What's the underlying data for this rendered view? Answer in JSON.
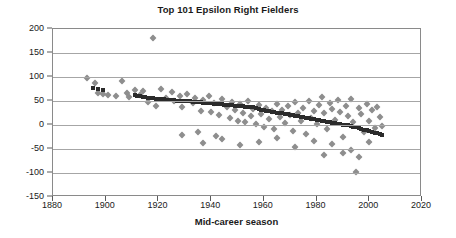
{
  "chart_data": {
    "type": "scatter",
    "title": "Top 101 Epsilon Right Fielders",
    "xlabel": "Mid-career season",
    "ylabel": "",
    "xlim": [
      1880,
      2020
    ],
    "ylim": [
      -150,
      200
    ],
    "xticks": [
      1880,
      1900,
      1920,
      1940,
      1960,
      1980,
      2000,
      2020
    ],
    "yticks": [
      200,
      150,
      100,
      50,
      0,
      -50,
      -100,
      -150
    ],
    "grid": "horizontal",
    "legend": "none",
    "colors": {
      "series_fitted": "#2b2b2b",
      "series_observed": "#8e8e8e",
      "gridline": "#a6a6a6",
      "frame": "#8a8a8a",
      "text": "#1a1a1a",
      "background": "#ffffff"
    },
    "series": [
      {
        "name": "Fitted trend",
        "marker": "square",
        "color": "#2b2b2b",
        "points": [
          [
            1895,
            78
          ],
          [
            1897,
            74
          ],
          [
            1899,
            72
          ],
          [
            1911,
            62
          ],
          [
            1912,
            61
          ],
          [
            1913,
            60
          ],
          [
            1914,
            59
          ],
          [
            1915,
            58
          ],
          [
            1916,
            57
          ],
          [
            1917,
            56
          ],
          [
            1918,
            56
          ],
          [
            1919,
            55
          ],
          [
            1920,
            55
          ],
          [
            1921,
            54
          ],
          [
            1922,
            54
          ],
          [
            1923,
            53
          ],
          [
            1924,
            53
          ],
          [
            1925,
            52
          ],
          [
            1926,
            52
          ],
          [
            1927,
            51
          ],
          [
            1928,
            51
          ],
          [
            1929,
            50
          ],
          [
            1930,
            50
          ],
          [
            1931,
            49
          ],
          [
            1932,
            49
          ],
          [
            1933,
            48
          ],
          [
            1934,
            48
          ],
          [
            1935,
            47
          ],
          [
            1936,
            47
          ],
          [
            1937,
            46
          ],
          [
            1938,
            46
          ],
          [
            1939,
            45
          ],
          [
            1940,
            45
          ],
          [
            1941,
            44
          ],
          [
            1942,
            44
          ],
          [
            1943,
            43
          ],
          [
            1944,
            43
          ],
          [
            1945,
            42
          ],
          [
            1946,
            42
          ],
          [
            1947,
            41
          ],
          [
            1948,
            41
          ],
          [
            1949,
            40
          ],
          [
            1950,
            40
          ],
          [
            1951,
            39
          ],
          [
            1952,
            39
          ],
          [
            1953,
            38
          ],
          [
            1954,
            38
          ],
          [
            1955,
            37
          ],
          [
            1956,
            37
          ],
          [
            1957,
            36
          ],
          [
            1958,
            33
          ],
          [
            1959,
            32
          ],
          [
            1960,
            31
          ],
          [
            1961,
            30
          ],
          [
            1962,
            29
          ],
          [
            1963,
            28
          ],
          [
            1964,
            27
          ],
          [
            1965,
            26
          ],
          [
            1966,
            25
          ],
          [
            1967,
            24
          ],
          [
            1968,
            23
          ],
          [
            1969,
            22
          ],
          [
            1970,
            21
          ],
          [
            1971,
            20
          ],
          [
            1972,
            19
          ],
          [
            1973,
            18
          ],
          [
            1974,
            17
          ],
          [
            1975,
            16
          ],
          [
            1976,
            15
          ],
          [
            1977,
            14
          ],
          [
            1978,
            13
          ],
          [
            1979,
            12
          ],
          [
            1980,
            11
          ],
          [
            1981,
            10
          ],
          [
            1982,
            9
          ],
          [
            1983,
            8
          ],
          [
            1984,
            7
          ],
          [
            1985,
            6
          ],
          [
            1986,
            5
          ],
          [
            1987,
            4
          ],
          [
            1988,
            3
          ],
          [
            1989,
            2
          ],
          [
            1990,
            1
          ],
          [
            1991,
            0
          ],
          [
            1992,
            -1
          ],
          [
            1993,
            -3
          ],
          [
            1994,
            -4
          ],
          [
            1995,
            -5
          ],
          [
            1996,
            -7
          ],
          [
            1997,
            -8
          ],
          [
            1998,
            -10
          ],
          [
            1999,
            -11
          ],
          [
            2000,
            -13
          ],
          [
            2001,
            -14
          ],
          [
            2002,
            -16
          ],
          [
            2003,
            -17
          ],
          [
            2004,
            -19
          ],
          [
            2005,
            -20
          ]
        ]
      },
      {
        "name": "Observed value",
        "marker": "diamond",
        "color": "#8e8e8e",
        "points": [
          [
            1893,
            97
          ],
          [
            1896,
            88
          ],
          [
            1897,
            66
          ],
          [
            1899,
            64
          ],
          [
            1901,
            63
          ],
          [
            1904,
            60
          ],
          [
            1906,
            92
          ],
          [
            1908,
            67
          ],
          [
            1909,
            58
          ],
          [
            1911,
            72
          ],
          [
            1913,
            63
          ],
          [
            1914,
            70
          ],
          [
            1916,
            48
          ],
          [
            1918,
            182
          ],
          [
            1919,
            40
          ],
          [
            1921,
            74
          ],
          [
            1923,
            56
          ],
          [
            1925,
            68
          ],
          [
            1926,
            49
          ],
          [
            1928,
            60
          ],
          [
            1929,
            37
          ],
          [
            1931,
            64
          ],
          [
            1933,
            45
          ],
          [
            1934,
            57
          ],
          [
            1936,
            30
          ],
          [
            1937,
            52
          ],
          [
            1939,
            61
          ],
          [
            1940,
            28
          ],
          [
            1941,
            46
          ],
          [
            1943,
            20
          ],
          [
            1944,
            55
          ],
          [
            1946,
            38
          ],
          [
            1947,
            14
          ],
          [
            1948,
            48
          ],
          [
            1949,
            31
          ],
          [
            1950,
            9
          ],
          [
            1951,
            43
          ],
          [
            1952,
            25
          ],
          [
            1953,
            6
          ],
          [
            1954,
            51
          ],
          [
            1955,
            18
          ],
          [
            1956,
            34
          ],
          [
            1957,
            2
          ],
          [
            1958,
            41
          ],
          [
            1959,
            22
          ],
          [
            1960,
            -4
          ],
          [
            1961,
            36
          ],
          [
            1962,
            12
          ],
          [
            1963,
            29
          ],
          [
            1964,
            -8
          ],
          [
            1965,
            44
          ],
          [
            1966,
            17
          ],
          [
            1967,
            32
          ],
          [
            1968,
            5
          ],
          [
            1969,
            39
          ],
          [
            1970,
            21
          ],
          [
            1971,
            -12
          ],
          [
            1972,
            47
          ],
          [
            1973,
            26
          ],
          [
            1974,
            8
          ],
          [
            1975,
            35
          ],
          [
            1976,
            -18
          ],
          [
            1977,
            50
          ],
          [
            1978,
            15
          ],
          [
            1979,
            30
          ],
          [
            1980,
            3
          ],
          [
            1981,
            42
          ],
          [
            1982,
            58
          ],
          [
            1983,
            24
          ],
          [
            1984,
            -9
          ],
          [
            1985,
            46
          ],
          [
            1986,
            33
          ],
          [
            1987,
            11
          ],
          [
            1988,
            52
          ],
          [
            1989,
            27
          ],
          [
            1990,
            -24
          ],
          [
            1991,
            40
          ],
          [
            1992,
            19
          ],
          [
            1993,
            55
          ],
          [
            1994,
            6
          ],
          [
            1995,
            -97
          ],
          [
            1996,
            36
          ],
          [
            1997,
            23
          ],
          [
            1998,
            -14
          ],
          [
            1999,
            44
          ],
          [
            2000,
            9
          ],
          [
            2001,
            31
          ],
          [
            2002,
            -6
          ],
          [
            2003,
            38
          ],
          [
            2004,
            16
          ],
          [
            2005,
            -2
          ],
          [
            1937,
            -38
          ],
          [
            1944,
            -30
          ],
          [
            1951,
            -42
          ],
          [
            1958,
            -35
          ],
          [
            1965,
            -28
          ],
          [
            1972,
            -45
          ],
          [
            1979,
            -33
          ],
          [
            1986,
            -40
          ],
          [
            1993,
            -52
          ],
          [
            2000,
            -36
          ],
          [
            1983,
            -62
          ],
          [
            1990,
            -58
          ],
          [
            1996,
            -67
          ],
          [
            1929,
            -20
          ],
          [
            1935,
            -15
          ],
          [
            1942,
            -22
          ]
        ]
      }
    ]
  }
}
